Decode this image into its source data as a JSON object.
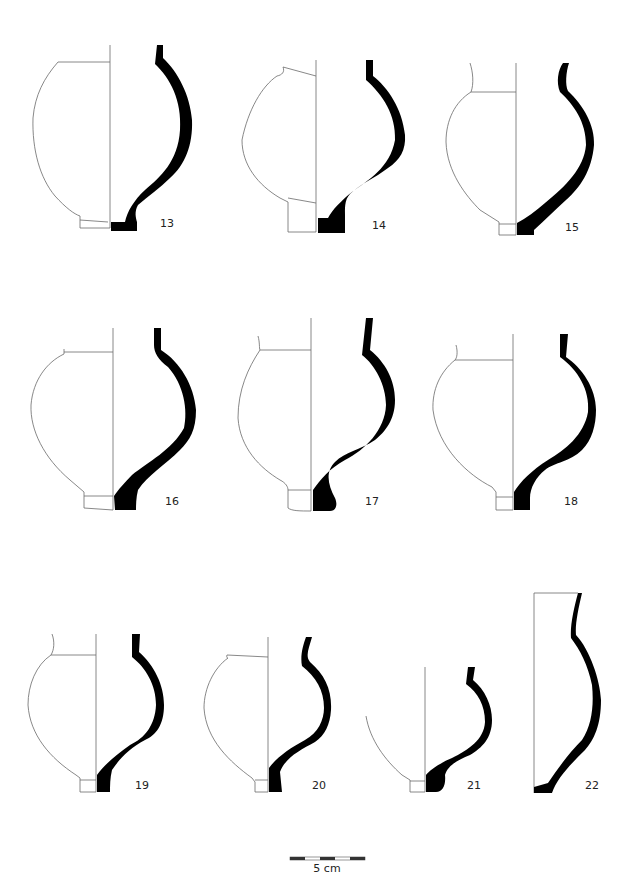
{
  "plate": {
    "type": "pottery profile drawings",
    "vessels": [
      {
        "number": "13"
      },
      {
        "number": "14"
      },
      {
        "number": "15"
      },
      {
        "number": "16"
      },
      {
        "number": "17"
      },
      {
        "number": "18"
      },
      {
        "number": "19"
      },
      {
        "number": "20"
      },
      {
        "number": "21"
      },
      {
        "number": "22"
      }
    ],
    "scale_bar": {
      "label": "5 cm",
      "segments": 5
    },
    "colors": {
      "section_fill": "#000000",
      "outline": "#6a6a6a",
      "background": "#ffffff"
    }
  }
}
